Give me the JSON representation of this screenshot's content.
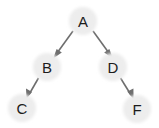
{
  "diagram": {
    "type": "binary-tree",
    "background_color": "#ffffff",
    "node_fill_color": "#ededed",
    "node_label_color": "#1c1c1c",
    "edge_color": "#6e6e6e",
    "node_radius": 14,
    "nodes": [
      {
        "id": "A",
        "label": "A",
        "cx": 83,
        "cy": 21,
        "role": "root"
      },
      {
        "id": "B",
        "label": "B",
        "cx": 47,
        "cy": 67,
        "role": "left-child-of-A"
      },
      {
        "id": "D",
        "label": "D",
        "cx": 113,
        "cy": 67,
        "role": "right-child-of-A"
      },
      {
        "id": "C",
        "label": "C",
        "cx": 22,
        "cy": 108,
        "role": "left-child-of-B"
      },
      {
        "id": "F",
        "label": "F",
        "cx": 137,
        "cy": 109,
        "role": "right-child-of-D"
      }
    ],
    "edges": [
      {
        "id": "A-B",
        "from": "A",
        "to": "B",
        "directed": true,
        "arrow": "to"
      },
      {
        "id": "A-D",
        "from": "A",
        "to": "D",
        "directed": true,
        "arrow": "to"
      },
      {
        "id": "B-C",
        "from": "B",
        "to": "C",
        "directed": true,
        "arrow": "to"
      },
      {
        "id": "D-F",
        "from": "D",
        "to": "F",
        "directed": true,
        "arrow": "to"
      }
    ]
  }
}
